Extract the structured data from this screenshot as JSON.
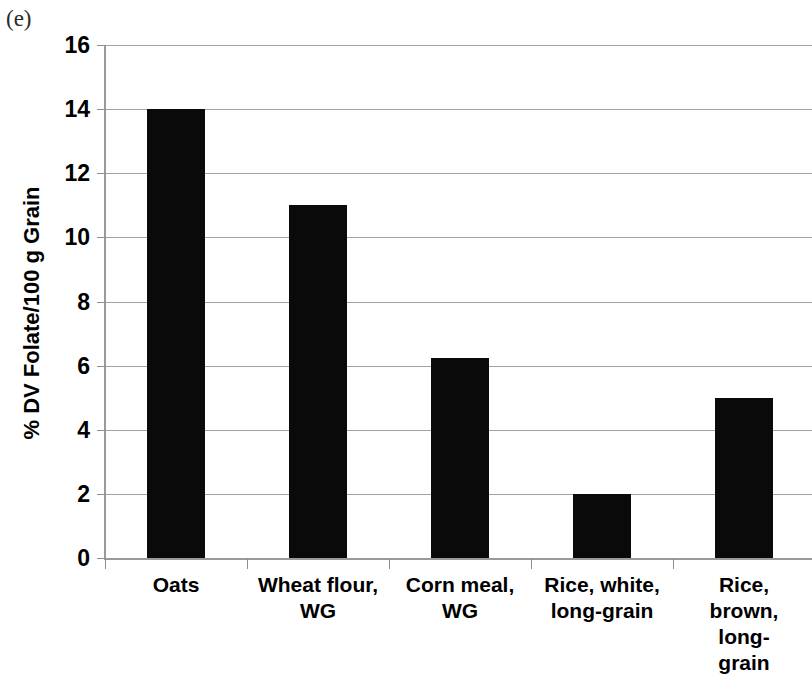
{
  "panel": {
    "label": "(e)"
  },
  "chart_data": {
    "type": "bar",
    "title": "",
    "panel_label": "(e)",
    "xlabel": "",
    "ylabel": "% DV Folate/100 g Grain",
    "categories": [
      "Oats",
      "Wheat flour, WG",
      "Corn meal, WG",
      "Rice, white, long-grain",
      "Rice, brown, long-grain"
    ],
    "category_lines": [
      [
        "Oats"
      ],
      [
        "Wheat flour,",
        "WG"
      ],
      [
        "Corn meal,",
        "WG"
      ],
      [
        "Rice, white,",
        "long-grain"
      ],
      [
        "Rice, brown,",
        "long-grain"
      ]
    ],
    "values": [
      14,
      11,
      6.25,
      2,
      5
    ],
    "ylim": [
      0,
      16
    ],
    "ytick_step": 2,
    "yticks": [
      0,
      2,
      4,
      6,
      8,
      10,
      12,
      14,
      16
    ],
    "ytick_labels": [
      "0",
      "2",
      "4",
      "6",
      "8",
      "10",
      "12",
      "14",
      "16"
    ],
    "grid": true,
    "legend": "none",
    "bar_color": "#0a0a0a",
    "grid_color": "#a2a2a2",
    "axis_color": "#8f8f8f"
  }
}
